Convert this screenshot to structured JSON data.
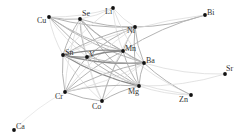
{
  "diagram": {
    "type": "network",
    "colors": {
      "node": "#111111",
      "label": "#333333",
      "edge_strong": "#8a8a8a",
      "edge_medium": "#b4b4b4",
      "edge_weak": "#dcdcdc"
    },
    "nodes": [
      {
        "id": "Cu",
        "label": "Cu",
        "x": 49,
        "y": 17,
        "lx": -12,
        "ly": 6
      },
      {
        "id": "Se",
        "label": "Se",
        "x": 80,
        "y": 19,
        "lx": 2,
        "ly": -3
      },
      {
        "id": "Li",
        "label": "Li",
        "x": 113,
        "y": 8,
        "lx": -8,
        "ly": 6
      },
      {
        "id": "Ni",
        "label": "Ni",
        "x": 135,
        "y": 27,
        "lx": -8,
        "ly": 6
      },
      {
        "id": "Bi",
        "label": "Bi",
        "x": 205,
        "y": 15,
        "lx": 2,
        "ly": 0
      },
      {
        "id": "Mn",
        "label": "Mn",
        "x": 123,
        "y": 51,
        "lx": 2,
        "ly": 0
      },
      {
        "id": "Sn",
        "label": "Sn",
        "x": 63,
        "y": 55,
        "lx": 2,
        "ly": 0
      },
      {
        "id": "V",
        "label": "V",
        "x": 87,
        "y": 57,
        "lx": 2,
        "ly": 0
      },
      {
        "id": "Ba",
        "label": "Ba",
        "x": 144,
        "y": 63,
        "lx": 2,
        "ly": 0
      },
      {
        "id": "Sr",
        "label": "Sr",
        "x": 225,
        "y": 74,
        "lx": 1,
        "ly": -3
      },
      {
        "id": "Mg",
        "label": "Mg",
        "x": 139,
        "y": 86,
        "lx": -11,
        "ly": 8
      },
      {
        "id": "Zn",
        "label": "Zn",
        "x": 191,
        "y": 95,
        "lx": -12,
        "ly": 7
      },
      {
        "id": "Cr",
        "label": "Cr",
        "x": 65,
        "y": 92,
        "lx": -10,
        "ly": 7
      },
      {
        "id": "Co",
        "label": "Co",
        "x": 102,
        "y": 101,
        "lx": -10,
        "ly": 8
      },
      {
        "id": "Ca",
        "label": "Ca",
        "x": 14,
        "y": 130,
        "lx": 2,
        "ly": -1
      }
    ],
    "edges": [
      [
        "Cu",
        "Se",
        2
      ],
      [
        "Cu",
        "Ni",
        2
      ],
      [
        "Cu",
        "Mn",
        2
      ],
      [
        "Cu",
        "Ba",
        2
      ],
      [
        "Cu",
        "Mg",
        2
      ],
      [
        "Cu",
        "Sn",
        1
      ],
      [
        "Cu",
        "V",
        1
      ],
      [
        "Cu",
        "Li",
        1
      ],
      [
        "Se",
        "Li",
        1
      ],
      [
        "Se",
        "Ni",
        2
      ],
      [
        "Se",
        "Mn",
        2
      ],
      [
        "Se",
        "Sn",
        2
      ],
      [
        "Se",
        "V",
        2
      ],
      [
        "Se",
        "Ba",
        2
      ],
      [
        "Se",
        "Mg",
        2
      ],
      [
        "Se",
        "Cr",
        1
      ],
      [
        "Se",
        "Co",
        1
      ],
      [
        "Li",
        "Ni",
        1
      ],
      [
        "Li",
        "Sn",
        1
      ],
      [
        "Li",
        "Mn",
        1
      ],
      [
        "Li",
        "Ba",
        1
      ],
      [
        "Ni",
        "Bi",
        2
      ],
      [
        "Ni",
        "Mn",
        2
      ],
      [
        "Ni",
        "Sn",
        2
      ],
      [
        "Ni",
        "V",
        2
      ],
      [
        "Ni",
        "Ba",
        2
      ],
      [
        "Ni",
        "Mg",
        2
      ],
      [
        "Ni",
        "Cr",
        1
      ],
      [
        "Ni",
        "Co",
        1
      ],
      [
        "Bi",
        "Mn",
        2
      ],
      [
        "Bi",
        "Sn",
        1
      ],
      [
        "Mn",
        "Sn",
        3
      ],
      [
        "Mn",
        "V",
        3
      ],
      [
        "Mn",
        "Ba",
        2
      ],
      [
        "Mn",
        "Mg",
        2
      ],
      [
        "Mn",
        "Cr",
        2
      ],
      [
        "Mn",
        "Co",
        2
      ],
      [
        "Mn",
        "Zn",
        1
      ],
      [
        "Sn",
        "V",
        3
      ],
      [
        "Sn",
        "Ba",
        3
      ],
      [
        "Sn",
        "Mg",
        3
      ],
      [
        "Sn",
        "Cr",
        2
      ],
      [
        "Sn",
        "Co",
        1
      ],
      [
        "V",
        "Ba",
        2
      ],
      [
        "V",
        "Mg",
        2
      ],
      [
        "V",
        "Cr",
        2
      ],
      [
        "V",
        "Co",
        1
      ],
      [
        "Ba",
        "Sr",
        1
      ],
      [
        "Ba",
        "Zn",
        2
      ],
      [
        "Ba",
        "Mg",
        2
      ],
      [
        "Ba",
        "Cr",
        2
      ],
      [
        "Ba",
        "Co",
        1
      ],
      [
        "Mg",
        "Sr",
        1
      ],
      [
        "Mg",
        "Zn",
        1
      ],
      [
        "Mg",
        "Cr",
        2
      ],
      [
        "Mg",
        "Co",
        2
      ],
      [
        "Cr",
        "Co",
        2
      ],
      [
        "Cr",
        "Ca",
        0
      ],
      [
        "Sn",
        "Zn",
        1
      ],
      [
        "Cr",
        "Ba",
        1
      ]
    ]
  }
}
